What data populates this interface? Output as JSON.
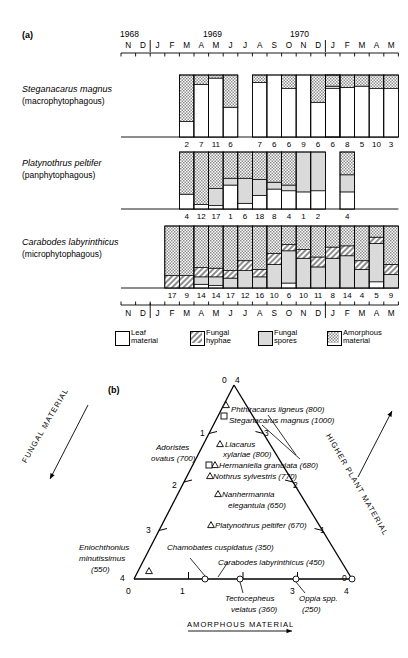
{
  "figure": {
    "panel_a_tag": "(a)",
    "panel_b_tag": "(b)"
  },
  "panel_a": {
    "years": [
      "1968",
      "1969",
      "1970"
    ],
    "month_letters": [
      "N",
      "D",
      "J",
      "F",
      "M",
      "A",
      "M",
      "J",
      "J",
      "A",
      "S",
      "O",
      "N",
      "D",
      "J",
      "F",
      "M",
      "A",
      "M"
    ],
    "species": [
      {
        "name": "Steganacarus magnus",
        "feeding": "(macrophytophagous)",
        "counts": [
          "2",
          "7",
          "11",
          "6",
          "7",
          "6",
          "6",
          "9",
          "6",
          "6",
          "8",
          "5",
          "10",
          "3"
        ]
      },
      {
        "name": "Platynothrus peltifer",
        "feeding": "(panphytophagous)",
        "counts": [
          "4",
          "12",
          "17",
          "1",
          "6",
          "18",
          "8",
          "4",
          "1",
          "2",
          "4"
        ]
      },
      {
        "name": "Carabodes labyrinthicus",
        "feeding": "(microphytophagous)",
        "counts": [
          "17",
          "9",
          "14",
          "14",
          "17",
          "12",
          "16",
          "10",
          "6",
          "10",
          "11",
          "8",
          "14",
          "4",
          "5",
          "9"
        ]
      }
    ],
    "legend": [
      {
        "line1": "Leaf",
        "line2": "material",
        "swatch": "leaf"
      },
      {
        "line1": "Fungal",
        "line2": "hyphae",
        "swatch": "hyphae"
      },
      {
        "line1": "Fungal",
        "line2": "spores",
        "swatch": "spores"
      },
      {
        "line1": "Amorphous",
        "line2": "material",
        "swatch": "amorphous"
      }
    ]
  },
  "chart_data": [
    {
      "type": "bar",
      "title": "Steganacarus magnus (macrophytophagous)",
      "xlabel": "",
      "ylabel": "Gut content composition (%)",
      "ylim": [
        0,
        100
      ],
      "categories": [
        "M-1969a",
        "A",
        "M",
        "J",
        "J",
        "A",
        "S",
        "O",
        "N",
        "D",
        "J-1970",
        "F",
        "M",
        "A",
        "M"
      ],
      "legend": [
        "Leaf material",
        "Fungal hyphae",
        "Fungal spores",
        "Amorphous material"
      ],
      "series": [
        {
          "name": "Leaf material",
          "values": [
            25,
            85,
            95,
            48,
            88,
            100,
            78,
            100,
            56,
            78,
            80,
            82,
            78,
            78
          ]
        },
        {
          "name": "Fungal hyphae",
          "values": [
            0,
            0,
            0,
            0,
            0,
            0,
            0,
            0,
            0,
            0,
            0,
            0,
            0,
            0
          ]
        },
        {
          "name": "Fungal spores",
          "values": [
            0,
            0,
            0,
            0,
            0,
            0,
            0,
            0,
            0,
            4,
            0,
            0,
            0,
            0
          ]
        },
        {
          "name": "Amorphous material",
          "values": [
            75,
            15,
            5,
            52,
            12,
            0,
            22,
            0,
            44,
            18,
            20,
            18,
            22,
            22
          ]
        }
      ]
    },
    {
      "type": "bar",
      "title": "Platynothrus peltifer (panphytophagous)",
      "xlabel": "",
      "ylabel": "Gut content composition (%)",
      "ylim": [
        0,
        100
      ],
      "categories": [
        "M-1969",
        "A",
        "M",
        "J",
        "J",
        "A",
        "S",
        "O",
        "N",
        "D",
        "F-1970"
      ],
      "legend": [
        "Leaf material",
        "Fungal hyphae",
        "Fungal spores",
        "Amorphous material"
      ],
      "series": [
        {
          "name": "Leaf material",
          "values": [
            26,
            8,
            6,
            42,
            10,
            24,
            35,
            32,
            30,
            32,
            30
          ]
        },
        {
          "name": "Fungal hyphae",
          "values": [
            0,
            0,
            0,
            0,
            0,
            0,
            0,
            0,
            0,
            0,
            0
          ]
        },
        {
          "name": "Fungal spores",
          "values": [
            0,
            0,
            30,
            12,
            44,
            28,
            12,
            10,
            70,
            68,
            30
          ]
        },
        {
          "name": "Amorphous material",
          "values": [
            74,
            92,
            64,
            46,
            46,
            48,
            53,
            58,
            0,
            0,
            40
          ]
        }
      ]
    },
    {
      "type": "bar",
      "title": "Carabodes labyrinthicus (microphytophagous)",
      "xlabel": "",
      "ylabel": "Gut content composition (%)",
      "ylim": [
        0,
        100
      ],
      "categories": [
        "F-1969",
        "M",
        "A",
        "M",
        "J",
        "J",
        "A",
        "S",
        "O",
        "N",
        "D",
        "J-1970",
        "F",
        "M",
        "A",
        "M"
      ],
      "legend": [
        "Leaf material",
        "Fungal hyphae",
        "Fungal spores",
        "Amorphous material"
      ],
      "series": [
        {
          "name": "Leaf material",
          "values": [
            0,
            0,
            6,
            4,
            0,
            0,
            0,
            0,
            8,
            0,
            0,
            0,
            0,
            0,
            10,
            0
          ]
        },
        {
          "name": "Fungal hyphae",
          "values": [
            20,
            20,
            15,
            14,
            12,
            16,
            12,
            18,
            10,
            14,
            16,
            18,
            16,
            14,
            10,
            16
          ]
        },
        {
          "name": "Fungal spores",
          "values": [
            0,
            0,
            12,
            14,
            16,
            28,
            18,
            38,
            52,
            48,
            34,
            48,
            52,
            30,
            62,
            22
          ]
        },
        {
          "name": "Amorphous material",
          "values": [
            80,
            80,
            67,
            68,
            72,
            56,
            70,
            44,
            30,
            38,
            50,
            34,
            32,
            56,
            18,
            62
          ]
        }
      ]
    }
  ],
  "panel_b": {
    "apex_labels": {
      "top_left": "0",
      "top_right": "4"
    },
    "left_axis_title": "FUNGAL MATERIAL",
    "right_axis_title": "HIGHER PLANT MATERIAL",
    "bottom_axis_title": "AMORPHOUS MATERIAL",
    "left_ticks": [
      "1",
      "2",
      "3",
      "4"
    ],
    "right_ticks": [
      "3",
      "2",
      "1",
      "0"
    ],
    "bottom_ticks": [
      "0",
      "1",
      "2",
      "3",
      "4"
    ],
    "bottom_left_corner": "4",
    "bottom_right_corner": "0",
    "species": [
      {
        "label": "Phthiracarus ligneus (800)",
        "marker": "triangle"
      },
      {
        "label": "Steganacarus magnus (1000)",
        "marker": "square"
      },
      {
        "label": "Liacarus xylariae (800)",
        "marker": "triangle"
      },
      {
        "label": "Hermaniella granulata (680)",
        "marker": "triangle-square"
      },
      {
        "label": "Nothrus sylvestris (770)",
        "marker": "triangle"
      },
      {
        "label": "Nanhermannia elegantula (650)",
        "marker": "triangle"
      },
      {
        "label": "Platynothrus peltifer (670)",
        "marker": "triangle"
      },
      {
        "label": "Adoristes ovatus (700)",
        "marker": "none"
      },
      {
        "label": "Eniochthonius minutissimus (550)",
        "marker": "triangle"
      },
      {
        "label": "Chamobates cuspidatus (350)",
        "marker": "circle"
      },
      {
        "label": "Carabodes labyrinthicus (450)",
        "marker": "circle"
      },
      {
        "label": "Tectocepheus velatus (360)",
        "marker": "circle"
      },
      {
        "label": "Oppia spp. (250)",
        "marker": "circle"
      }
    ],
    "text": {
      "phthiracarus": "Phthiracarus  ligneus  (800)",
      "steganacarus": "Steganacarus  magnus (1000)",
      "liacarus_l1": "Liacarus",
      "liacarus_l2": "xylariae (800)",
      "hermaniella": "Hermaniella granulata (680)",
      "nothrus": "Nothrus sylvestris (770)",
      "nanhermannia_l1": "Nanhermannia",
      "nanhermannia_l2": "elegantula  (650)",
      "platynothrus": "Platynothrus peltifer  (670)",
      "adoristes_l1": "Adoristes",
      "adoristes_l2": "ovatus (700)",
      "eniochthonius_l1": "Eniochthonius",
      "eniochthonius_l2": "minutissimus",
      "eniochthonius_l3": "(550)",
      "chamobates": "Chamobates cuspidatus  (350)",
      "carabodes": "Carabodes labyrinthicus  (450)",
      "tectocepheus_l1": "Tectocepheus",
      "tectocepheus_l2": "velatus (360)",
      "oppia_l1": "Oppia spp.",
      "oppia_l2": "(250)"
    }
  },
  "colors": {
    "ink": "#000000",
    "leaf": "#ffffff",
    "hyphae": "#9a9a9a",
    "spores": "#d8d8d8",
    "amorphous": "#b4b4b4"
  }
}
